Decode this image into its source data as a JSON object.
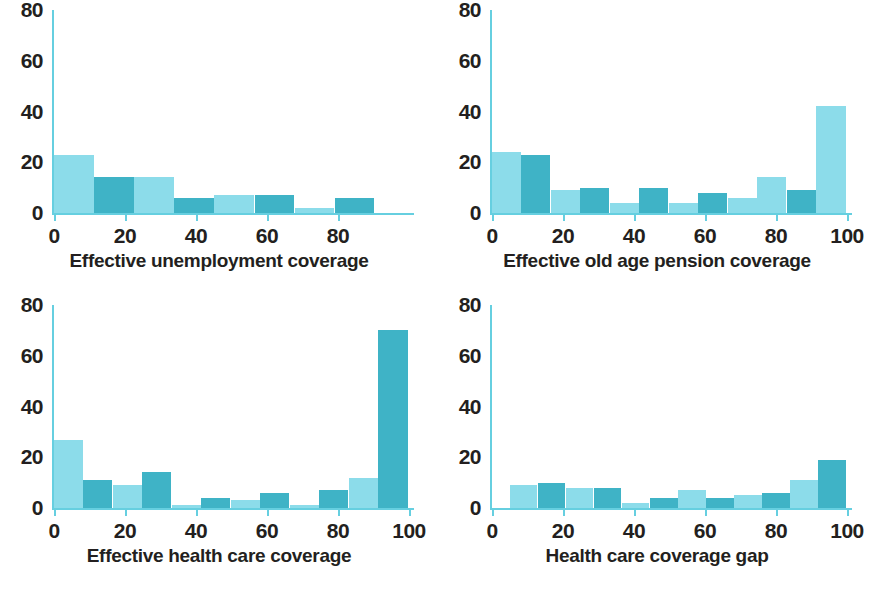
{
  "figure": {
    "background": "#ffffff",
    "colors": {
      "light": "#8CDCEA",
      "dark": "#3FB3C6",
      "axis": "#66cfe0",
      "text": "#231f20"
    }
  },
  "panels": [
    {
      "id": "tl",
      "axis_title": "Effective unemployment coverage"
    },
    {
      "id": "tr",
      "axis_title": "Effective old age pension coverage"
    },
    {
      "id": "bl",
      "axis_title": "Effective health care coverage"
    },
    {
      "id": "br",
      "axis_title": "Health care coverage gap"
    }
  ],
  "chart_data": [
    {
      "type": "bar",
      "title": "",
      "xlabel": "Effective unemployment coverage",
      "ylabel": "",
      "xlim": [
        0,
        100
      ],
      "ylim": [
        0,
        80
      ],
      "grid": false,
      "legend": null,
      "xticks": [
        0,
        20,
        40,
        60,
        80
      ],
      "yticks": [
        0,
        20,
        40,
        60,
        80
      ],
      "bin_edges": [
        0,
        11.3,
        22.6,
        33.9,
        45.2,
        56.5,
        67.8,
        79.1,
        90.4
      ],
      "values": [
        23,
        14,
        14,
        6,
        7,
        7,
        2,
        6
      ],
      "bar_colors": [
        "light",
        "dark",
        "light",
        "dark",
        "light",
        "dark",
        "light",
        "dark"
      ]
    },
    {
      "type": "bar",
      "title": "",
      "xlabel": "Effective old age pension coverage",
      "ylabel": "",
      "xlim": [
        0,
        100
      ],
      "ylim": [
        0,
        80
      ],
      "grid": false,
      "legend": null,
      "xticks": [
        0,
        20,
        40,
        60,
        80,
        100
      ],
      "yticks": [
        0,
        20,
        40,
        60,
        80
      ],
      "bin_edges": [
        0,
        8.3,
        16.6,
        24.9,
        33.2,
        41.5,
        49.8,
        58.1,
        66.4,
        74.7,
        83.0,
        91.3,
        100
      ],
      "values": [
        24,
        23,
        9,
        10,
        4,
        10,
        4,
        8,
        6,
        14,
        9,
        42
      ],
      "bar_colors": [
        "light",
        "dark",
        "light",
        "dark",
        "light",
        "dark",
        "light",
        "dark",
        "light",
        "light",
        "dark",
        "light"
      ]
    },
    {
      "type": "bar",
      "title": "",
      "xlabel": "Effective health care coverage",
      "ylabel": "",
      "xlim": [
        0,
        100
      ],
      "ylim": [
        0,
        80
      ],
      "grid": false,
      "legend": null,
      "xticks": [
        0,
        20,
        40,
        60,
        80,
        100
      ],
      "yticks": [
        0,
        20,
        40,
        60,
        80
      ],
      "bin_edges": [
        0,
        8.3,
        16.6,
        24.9,
        33.2,
        41.5,
        49.8,
        58.1,
        66.4,
        74.7,
        83.0,
        91.3,
        100
      ],
      "values": [
        27,
        11,
        9,
        14,
        1,
        4,
        3,
        6,
        1,
        7,
        12,
        70
      ],
      "bar_colors": [
        "light",
        "dark",
        "light",
        "dark",
        "light",
        "dark",
        "light",
        "dark",
        "light",
        "dark",
        "light",
        "dark"
      ]
    },
    {
      "type": "bar",
      "title": "",
      "xlabel": "Health care coverage gap",
      "ylabel": "",
      "xlim": [
        0,
        100
      ],
      "ylim": [
        0,
        80
      ],
      "grid": false,
      "legend": null,
      "xticks": [
        0,
        20,
        40,
        60,
        80,
        100
      ],
      "yticks": [
        0,
        20,
        40,
        60,
        80
      ],
      "bin_edges": [
        5,
        12.9,
        20.8,
        28.7,
        36.6,
        44.5,
        52.4,
        60.3,
        68.2,
        76.1,
        84.0,
        91.9,
        100
      ],
      "values": [
        9,
        10,
        8,
        8,
        2,
        4,
        7,
        4,
        5,
        6,
        11,
        19,
        76
      ],
      "bar_colors": [
        "light",
        "dark",
        "light",
        "dark",
        "light",
        "dark",
        "light",
        "dark",
        "light",
        "dark",
        "light",
        "dark",
        "light"
      ]
    }
  ]
}
